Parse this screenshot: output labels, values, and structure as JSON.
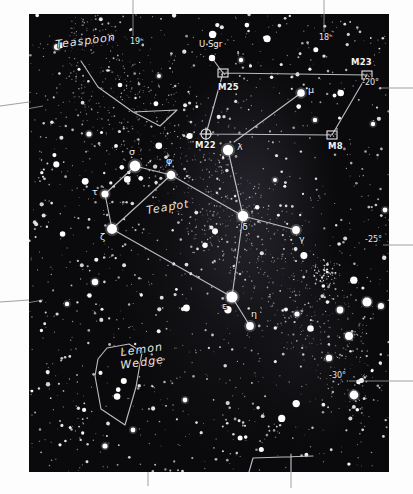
{
  "chart": {
    "sky_color": "#0a0a0c",
    "line_color": "#c9c9cf",
    "star_color": "#ffffff",
    "plate": {
      "x": 29,
      "y": 14,
      "width": 360,
      "height": 458
    }
  },
  "coordinates": {
    "ra_ticks": [
      {
        "label": "19ʰ",
        "x": 101,
        "y": 30,
        "tick_x": 104,
        "tick_y0": -14,
        "tick_y1": 22
      },
      {
        "label": "18ʰ",
        "x": 290,
        "y": 26,
        "tick_x": 295,
        "tick_y0": -14,
        "tick_y1": 18
      }
    ],
    "ra_ticks_text": [
      "19ʰ",
      "18ʰ"
    ],
    "dec_ticks": [
      {
        "label": "-20°",
        "x": 333,
        "y": 71,
        "tick_x0": 352,
        "tick_x1": 382,
        "tick_y": 74
      },
      {
        "label": "-25°",
        "x": 336,
        "y": 228,
        "tick_x0": 354,
        "tick_x1": 382,
        "tick_y": 231
      },
      {
        "label": "-30°",
        "x": 300,
        "y": 364,
        "tick_x0": 320,
        "tick_x1": 382,
        "tick_y": 367
      }
    ],
    "dec_ticks_text": [
      "-20°",
      "-25°",
      "-30°"
    ]
  },
  "asterisms": [
    {
      "name": "Teapot",
      "label": "Teapot",
      "x": 118,
      "y": 200,
      "rotation": -9
    },
    {
      "name": "Teaspoon",
      "label": "Teaspoon",
      "x": 27,
      "y": 34,
      "rotation": -7
    },
    {
      "name": "Lemon Wedge",
      "label_line1": "Lemon",
      "label_line2": "Wedge",
      "x": 92,
      "y": 342,
      "rotation": -8
    }
  ],
  "stars": [
    {
      "name": "sigma",
      "label": "σ",
      "x": 106,
      "y": 152,
      "r": 5.4,
      "lx": 100,
      "ly": 141
    },
    {
      "name": "phi",
      "label": "φ",
      "x": 142,
      "y": 161,
      "r": 4.3,
      "lx": 137,
      "ly": 150
    },
    {
      "name": "tau",
      "label": "τ",
      "x": 76,
      "y": 180,
      "r": 3.6,
      "lx": 63,
      "ly": 181
    },
    {
      "name": "zeta",
      "label": "ζ",
      "x": 83,
      "y": 215,
      "r": 5.0,
      "lx": 71,
      "ly": 226
    },
    {
      "name": "lambda",
      "label": "λ",
      "x": 199,
      "y": 136,
      "r": 5.2,
      "lx": 208,
      "ly": 136
    },
    {
      "name": "delta",
      "label": "δ",
      "x": 214,
      "y": 202,
      "r": 5.2,
      "lx": 213,
      "ly": 216
    },
    {
      "name": "gamma",
      "label": "γ",
      "x": 267,
      "y": 216,
      "r": 3.9,
      "lx": 270,
      "ly": 228
    },
    {
      "name": "epsilon",
      "label": "ε",
      "x": 203,
      "y": 283,
      "r": 5.6,
      "lx": 193,
      "ly": 295
    },
    {
      "name": "eta",
      "label": "η",
      "x": 221,
      "y": 312,
      "r": 3.9,
      "lx": 222,
      "ly": 303
    },
    {
      "name": "mu",
      "label": "μ",
      "x": 272,
      "y": 79,
      "r": 3.8,
      "lx": 279,
      "ly": 79
    }
  ],
  "stars_text": [
    "σ",
    "φ",
    "τ",
    "ζ",
    "λ",
    "δ",
    "γ",
    "ε",
    "η",
    "μ"
  ],
  "deep_sky": [
    {
      "name": "M25",
      "label": "M25",
      "type": "open-cluster",
      "x": 194,
      "y": 59,
      "lx": 189,
      "ly": 76
    },
    {
      "name": "M23",
      "label": "M23",
      "type": "open-cluster",
      "x": 338,
      "y": 61,
      "lx": 322,
      "ly": 51
    },
    {
      "name": "M8",
      "label": "M8",
      "type": "open-cluster",
      "x": 303,
      "y": 121,
      "lx": 299,
      "ly": 135
    },
    {
      "name": "M22",
      "label": "M22",
      "type": "globular-cluster",
      "x": 177,
      "y": 120,
      "lx": 166,
      "ly": 134
    }
  ],
  "deep_sky_text": [
    "M25",
    "M23",
    "M8",
    "M22"
  ],
  "variable_star": {
    "name": "U Sgr",
    "label": "U Sgr",
    "x": 183,
    "y": 44,
    "lx": 170,
    "ly": 33
  },
  "constellation_lines": {
    "teapot": [
      [
        106,
        152
      ],
      [
        142,
        161
      ],
      [
        199,
        136
      ],
      [
        214,
        202
      ],
      [
        267,
        216
      ]
    ],
    "teapot_body": [
      [
        76,
        180
      ],
      [
        106,
        152
      ],
      [
        142,
        161
      ],
      [
        214,
        202
      ],
      [
        203,
        283
      ],
      [
        83,
        215
      ],
      [
        76,
        180
      ]
    ],
    "teapot_spout": [
      [
        199,
        136
      ],
      [
        214,
        202
      ]
    ],
    "teapot_handle": [
      [
        142,
        161
      ],
      [
        83,
        215
      ]
    ],
    "teapot_eta": [
      [
        203,
        283
      ],
      [
        221,
        312
      ]
    ],
    "teapot_gamma": [
      [
        214,
        202
      ],
      [
        267,
        216
      ]
    ],
    "teaspoon": [
      [
        52,
        47
      ],
      [
        69,
        73
      ],
      [
        104,
        98
      ],
      [
        131,
        112
      ],
      [
        148,
        96
      ],
      [
        104,
        98
      ]
    ],
    "milky_box": [
      [
        194,
        59
      ],
      [
        338,
        61
      ],
      [
        303,
        121
      ],
      [
        177,
        120
      ],
      [
        194,
        59
      ]
    ],
    "mu_line": [
      [
        272,
        79
      ],
      [
        205,
        128
      ]
    ],
    "usgr_line": [
      [
        183,
        44
      ],
      [
        194,
        59
      ]
    ],
    "lemon_wedge": [
      [
        78,
        334
      ],
      [
        100,
        330
      ],
      [
        113,
        338
      ],
      [
        107,
        373
      ],
      [
        96,
        411
      ],
      [
        72,
        395
      ],
      [
        66,
        362
      ],
      [
        69,
        345
      ],
      [
        78,
        334
      ]
    ]
  }
}
